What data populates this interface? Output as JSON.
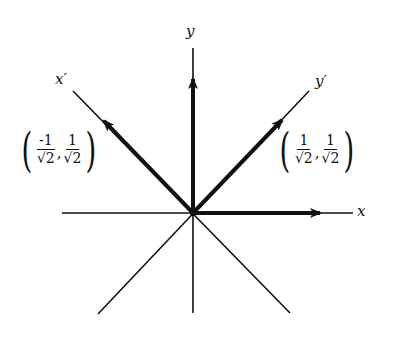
{
  "diagram": {
    "stroke_color": "#111111",
    "background": "#ffffff",
    "origin": [
      192,
      212
    ],
    "labels": {
      "x": "x",
      "y": "y",
      "x_prime": "x′",
      "y_prime": "y′"
    },
    "vectors": [
      {
        "name": "e1",
        "direction": "x",
        "tip": [
          318,
          212
        ]
      },
      {
        "name": "e2",
        "direction": "y",
        "tip": [
          192,
          80
        ]
      },
      {
        "name": "x_prime_unit",
        "direction": "x'",
        "tip": [
          105,
          122
        ],
        "label": {
          "x_num": "-1",
          "x_den": "√2",
          "y_num": "1",
          "y_den": "√2",
          "sep": ","
        }
      },
      {
        "name": "y_prime_unit",
        "direction": "y'",
        "tip": [
          280,
          122
        ],
        "label": {
          "x_num": "1",
          "x_den": "√2",
          "y_num": "1",
          "y_den": "√2",
          "sep": ","
        }
      }
    ],
    "lines": [
      {
        "name": "x-axis",
        "from": [
          62,
          213
        ],
        "to": [
          353,
          213
        ]
      },
      {
        "name": "y-axis",
        "from": [
          193,
          48
        ],
        "to": [
          193,
          313
        ]
      },
      {
        "name": "x-prime-axis",
        "from": [
          73,
          91
        ],
        "to": [
          290,
          313
        ]
      },
      {
        "name": "y-prime-axis",
        "from": [
          309,
          91
        ],
        "to": [
          98,
          314
        ]
      }
    ],
    "paren_open": "(",
    "paren_close": ")"
  }
}
